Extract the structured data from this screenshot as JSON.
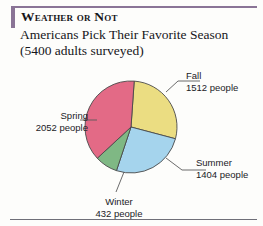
{
  "header": {
    "title": "Weather or Not",
    "subtitle_line1": "Americans Pick Their Favorite Season",
    "subtitle_line2": "(5400 adults surveyed)"
  },
  "labels": {
    "fall": {
      "name": "Fall",
      "value_text": "1512 people"
    },
    "summer": {
      "name": "Summer",
      "value_text": "1404 people"
    },
    "spring": {
      "name": "Spring",
      "value_text": "2052 people"
    },
    "winter": {
      "name": "Winter",
      "value_text": "432 people"
    }
  },
  "colors": {
    "fall": "#ebdd82",
    "summer": "#a5d4ed",
    "spring": "#e36a86",
    "winter": "#7fb884",
    "outline": "#4a4a4a",
    "accent_bar": "#8a7496",
    "text": "#16161a"
  },
  "chart_data": {
    "type": "pie",
    "title": "Weather or Not",
    "subtitle": "Americans Pick Their Favorite Season (5400 adults surveyed)",
    "total": 5400,
    "unit": "people",
    "categories": [
      "Fall",
      "Summer",
      "Winter",
      "Spring"
    ],
    "values": [
      1512,
      1404,
      432,
      2052
    ],
    "percentages": [
      28.0,
      26.0,
      8.0,
      38.0
    ],
    "slice_colors": [
      "#ebdd82",
      "#a5d4ed",
      "#7fb884",
      "#e36a86"
    ],
    "start_angle_deg": -86,
    "direction": "clockwise",
    "legend": "callout-labels",
    "grid": false
  }
}
